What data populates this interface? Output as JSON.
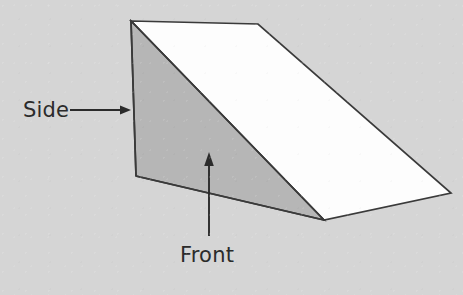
{
  "figure": {
    "title": "Triangular wedge solid with labelled faces",
    "background_color": "#d5d5d5",
    "outline_color": "#3a3a3a",
    "text_color": "#2b2b2b",
    "faces": [
      {
        "id": "front-face",
        "name": "Front",
        "fill_color": "#b6b6b6",
        "points": "131,21 136,176 324,220 324,220"
      },
      {
        "id": "slope-face",
        "name": "Slope",
        "fill_color": "#fdfdfd",
        "points": "131,21 258,24 451,193 324,220"
      },
      {
        "id": "side-face",
        "name": "Side",
        "fill_color": "#efefef",
        "points": "258,24 451,193 451,193"
      }
    ],
    "labels": [
      {
        "id": "side-label",
        "text": "Side",
        "x": 23,
        "y": 117,
        "anchor": "start"
      },
      {
        "id": "front-label",
        "text": "Front",
        "x": 180,
        "y": 262,
        "anchor": "start"
      }
    ],
    "leaders": [
      {
        "id": "side-leader",
        "name": "side-arrow",
        "direction": "right",
        "from": {
          "x": 70,
          "y": 110
        },
        "to": {
          "x": 130,
          "y": 110
        }
      },
      {
        "id": "front-leader",
        "name": "front-arrow",
        "direction": "up",
        "from": {
          "x": 209,
          "y": 236
        },
        "to": {
          "x": 209,
          "y": 153
        }
      }
    ]
  }
}
